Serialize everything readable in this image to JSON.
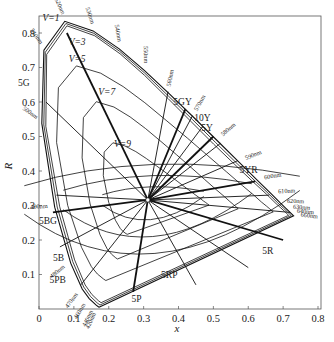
{
  "chart_data": {
    "type": "line",
    "title": "",
    "xlabel": "x",
    "ylabel": "R",
    "xlim": [
      0,
      0.8
    ],
    "ylim": [
      0,
      0.85
    ],
    "grid": false,
    "x_ticks": [
      "0",
      "0.1",
      "0.2",
      "0.3",
      "0.4",
      "0.5",
      "0.6",
      "0.7",
      "0.8"
    ],
    "y_ticks": [
      "0.1",
      "0.2",
      "0.3",
      "0.4",
      "0.5",
      "0.6",
      "0.7",
      "0.8"
    ],
    "white_point": {
      "x": 0.312,
      "y": 0.316
    },
    "spectral_locus": {
      "name": "spectrum locus",
      "points": [
        {
          "nm": "420nm",
          "x": 0.172,
          "y": 0.005
        },
        {
          "nm": "440nm",
          "x": 0.164,
          "y": 0.011
        },
        {
          "nm": "460nm",
          "x": 0.144,
          "y": 0.03
        },
        {
          "nm": "470nm",
          "x": 0.124,
          "y": 0.058
        },
        {
          "nm": "480nm",
          "x": 0.091,
          "y": 0.133
        },
        {
          "nm": "490nm",
          "x": 0.045,
          "y": 0.295
        },
        {
          "nm": "500nm",
          "x": 0.008,
          "y": 0.538
        },
        {
          "nm": "510nm",
          "x": 0.014,
          "y": 0.75
        },
        {
          "nm": "520nm",
          "x": 0.074,
          "y": 0.834
        },
        {
          "nm": "530nm",
          "x": 0.155,
          "y": 0.806
        },
        {
          "nm": "540nm",
          "x": 0.23,
          "y": 0.754
        },
        {
          "nm": "550nm",
          "x": 0.302,
          "y": 0.692
        },
        {
          "nm": "560nm",
          "x": 0.373,
          "y": 0.624
        },
        {
          "nm": "570nm",
          "x": 0.444,
          "y": 0.555
        },
        {
          "nm": "580nm",
          "x": 0.512,
          "y": 0.487
        },
        {
          "nm": "590nm",
          "x": 0.575,
          "y": 0.424
        },
        {
          "nm": "600nm",
          "x": 0.627,
          "y": 0.372
        },
        {
          "nm": "610nm",
          "x": 0.666,
          "y": 0.334
        },
        {
          "nm": "620nm",
          "x": 0.691,
          "y": 0.308
        },
        {
          "nm": "630nm",
          "x": 0.708,
          "y": 0.292
        },
        {
          "nm": "640nm",
          "x": 0.719,
          "y": 0.281
        },
        {
          "nm": "660nm",
          "x": 0.73,
          "y": 0.27
        }
      ]
    },
    "series": [
      {
        "name": "V=1",
        "label_pos": {
          "x": 0.01,
          "y": 0.835
        }
      },
      {
        "name": "V=3",
        "label_pos": {
          "x": 0.085,
          "y": 0.765
        }
      },
      {
        "name": "V=5",
        "label_pos": {
          "x": 0.085,
          "y": 0.715
        }
      },
      {
        "name": "V=7",
        "label_pos": {
          "x": 0.17,
          "y": 0.62
        }
      },
      {
        "name": "V=9",
        "label_pos": {
          "x": 0.215,
          "y": 0.47
        }
      }
    ],
    "hue_labels": [
      {
        "name": "5G",
        "x": -0.06,
        "y": 0.645
      },
      {
        "name": "5GY",
        "x": 0.385,
        "y": 0.59
      },
      {
        "name": "10Y",
        "x": 0.445,
        "y": 0.545
      },
      {
        "name": "5Y",
        "x": 0.465,
        "y": 0.515
      },
      {
        "name": "5YR",
        "x": 0.575,
        "y": 0.395
      },
      {
        "name": "5R",
        "x": 0.64,
        "y": 0.16
      },
      {
        "name": "5RP",
        "x": 0.35,
        "y": 0.09
      },
      {
        "name": "5P",
        "x": 0.265,
        "y": 0.02
      },
      {
        "name": "5PB",
        "x": 0.03,
        "y": 0.075
      },
      {
        "name": "5B",
        "x": 0.04,
        "y": 0.14
      },
      {
        "name": "5BG",
        "x": 0.0,
        "y": 0.245
      }
    ]
  },
  "labels": {
    "xlabel": "x",
    "ylabel": "R"
  }
}
